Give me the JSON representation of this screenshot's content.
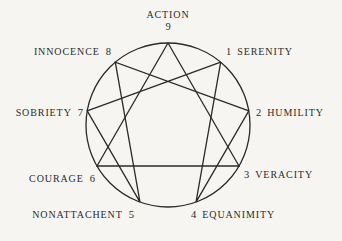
{
  "diagram": {
    "type": "enneagram",
    "circle": {
      "cx": 168,
      "cy": 125,
      "r": 82
    },
    "stroke_color": "#2a2a2a",
    "background_color": "#f6f5f1",
    "points": [
      {
        "number": "9",
        "virtue": "ACTION",
        "x": 168.0,
        "y": 43.0
      },
      {
        "number": "1",
        "virtue": "SERENITY",
        "x": 220.7,
        "y": 62.2
      },
      {
        "number": "2",
        "virtue": "HUMILITY",
        "x": 248.8,
        "y": 110.8
      },
      {
        "number": "3",
        "virtue": "VERACITY",
        "x": 239.0,
        "y": 166.0
      },
      {
        "number": "4",
        "virtue": "EQUANIMITY",
        "x": 196.0,
        "y": 202.1
      },
      {
        "number": "5",
        "virtue": "NONATTACHENT",
        "x": 140.0,
        "y": 202.1
      },
      {
        "number": "6",
        "virtue": "COURAGE",
        "x": 97.0,
        "y": 166.0
      },
      {
        "number": "7",
        "virtue": "SOBRIETY",
        "x": 87.2,
        "y": 110.8
      },
      {
        "number": "8",
        "virtue": "INNOCENCE",
        "x": 115.3,
        "y": 62.2
      }
    ],
    "triangle": [
      "9",
      "3",
      "6"
    ],
    "hexad": [
      "1",
      "4",
      "2",
      "8",
      "5",
      "7",
      "1"
    ]
  },
  "labels": {
    "p9": {
      "word": "ACTION",
      "num": "9"
    },
    "p1": {
      "num": "1",
      "word": "SERENITY"
    },
    "p2": {
      "num": "2",
      "word": "HUMILITY"
    },
    "p3": {
      "num": "3",
      "word": "VERACITY"
    },
    "p4": {
      "num": "4",
      "word": "EQUANIMITY"
    },
    "p5": {
      "word": "NONATTACHENT",
      "num": "5"
    },
    "p6": {
      "word": "COURAGE",
      "num": "6"
    },
    "p7": {
      "word": "SOBRIETY",
      "num": "7"
    },
    "p8": {
      "word": "INNOCENCE",
      "num": "8"
    }
  }
}
